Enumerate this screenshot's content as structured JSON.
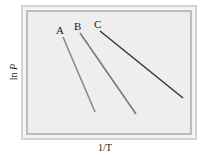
{
  "figure": {
    "xlabel": "1/T",
    "ylabel_prefix": "ln ",
    "ylabel_var": "P",
    "lines": [
      {
        "label": "A",
        "x1": 63,
        "y1": 37,
        "x2": 95,
        "y2": 112,
        "lx": 58,
        "ly": 33,
        "color": "#8a8a8a"
      },
      {
        "label": "B",
        "x1": 80,
        "y1": 33,
        "x2": 136,
        "y2": 114,
        "lx": 75,
        "ly": 29,
        "color": "#7a7a7a"
      },
      {
        "label": "C",
        "x1": 100,
        "y1": 31,
        "x2": 183,
        "y2": 98,
        "lx": 95,
        "ly": 27,
        "color": "#3a3a3a"
      }
    ],
    "colors": {
      "frame_outer": "#d4d4d4",
      "frame_inner": "#bdbdbd",
      "plot_bg": "#eeeeee"
    }
  }
}
